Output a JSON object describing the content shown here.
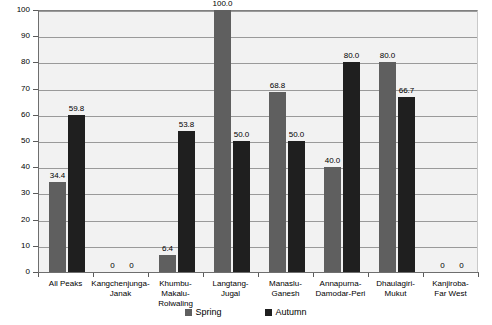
{
  "chart_data": {
    "type": "bar",
    "title": "",
    "xlabel": "",
    "ylabel": "",
    "ylim": [
      0,
      100
    ],
    "y_ticks": [
      0,
      10,
      20,
      30,
      40,
      50,
      60,
      70,
      80,
      90,
      100
    ],
    "grid": true,
    "legend_position": "bottom",
    "categories": [
      "All Peaks",
      "Kangchenjunga-Janak",
      "Khumbu-Makalu-Rolwaling",
      "Langtang-Jugal",
      "Manaslu-Ganesh",
      "Annapurna-Damodar-Peri",
      "Dhaulagiri-Mukut",
      "Kanjiroba-Far West"
    ],
    "category_lines": [
      [
        "All Peaks"
      ],
      [
        "Kangchenjunga-",
        "Janak"
      ],
      [
        "Khumbu-",
        "Makalu-",
        "Rolwaling"
      ],
      [
        "Langtang-",
        "Jugal"
      ],
      [
        "Manaslu-",
        "Ganesh"
      ],
      [
        "Annapurna-",
        "Damodar-Peri"
      ],
      [
        "Dhaulagiri-",
        "Mukut"
      ],
      [
        "Kanjiroba-",
        "Far West"
      ]
    ],
    "series": [
      {
        "name": "Spring",
        "color": "#5f5f5f",
        "values": [
          34.4,
          0,
          6.4,
          100.0,
          68.8,
          40.0,
          80.0,
          0
        ],
        "labels": [
          "34.4",
          "0",
          "6.4",
          "100.0",
          "68.8",
          "40.0",
          "80.0",
          "0"
        ]
      },
      {
        "name": "Autumn",
        "color": "#1f1f1f",
        "values": [
          59.8,
          0,
          53.8,
          50.0,
          50.0,
          80.0,
          66.7,
          0
        ],
        "labels": [
          "59.8",
          "0",
          "53.8",
          "50.0",
          "50.0",
          "80.0",
          "66.7",
          "0"
        ]
      }
    ]
  },
  "legend": {
    "items": [
      {
        "label": "Spring",
        "color": "#5f5f5f"
      },
      {
        "label": "Autumn",
        "color": "#1f1f1f"
      }
    ]
  }
}
